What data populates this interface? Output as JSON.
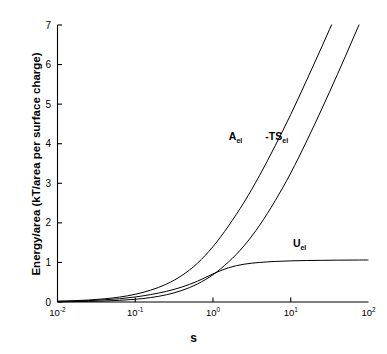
{
  "chart_data": {
    "type": "line",
    "title": "",
    "xlabel": "s",
    "ylabel": "Energy/area (kT/area per surface charge)",
    "xscale": "log",
    "yscale": "linear",
    "xlim": [
      0.01,
      100
    ],
    "ylim": [
      0,
      7
    ],
    "grid": false,
    "legend_position": "inline-annotations",
    "xticks": [
      {
        "value": 0.01,
        "base": "10",
        "exponent": "-2",
        "label": "10-2"
      },
      {
        "value": 0.1,
        "base": "10",
        "exponent": "-1",
        "label": "10-1"
      },
      {
        "value": 1,
        "base": "10",
        "exponent": "0",
        "label": "100"
      },
      {
        "value": 10,
        "base": "10",
        "exponent": "1",
        "label": "101"
      },
      {
        "value": 100,
        "base": "10",
        "exponent": "2",
        "label": "102"
      }
    ],
    "yticks": [
      {
        "value": 0,
        "label": "0"
      },
      {
        "value": 1,
        "label": "1"
      },
      {
        "value": 2,
        "label": "2"
      },
      {
        "value": 3,
        "label": "3"
      },
      {
        "value": 4,
        "label": "4"
      },
      {
        "value": 5,
        "label": "5"
      },
      {
        "value": 6,
        "label": "6"
      },
      {
        "value": 7,
        "label": "7"
      }
    ],
    "series": [
      {
        "name": "A_el",
        "label_base": "A",
        "label_sub": "el",
        "label_prefix": "",
        "color": "#000000",
        "annotation": {
          "x": 1.95,
          "y": 4.1
        },
        "x": [
          0.01,
          0.0158,
          0.0251,
          0.0398,
          0.0631,
          0.1,
          0.158,
          0.251,
          0.398,
          0.631,
          1.0,
          1.58,
          2.51,
          3.98,
          6.31,
          10.0,
          15.8,
          25.1,
          39.8,
          63.1,
          100.0
        ],
        "y": [
          0.02,
          0.032,
          0.05,
          0.08,
          0.125,
          0.195,
          0.3,
          0.45,
          0.67,
          0.98,
          1.4,
          1.92,
          2.52,
          3.2,
          3.95,
          4.74,
          5.58,
          6.45,
          7.34,
          8.25,
          9.18
        ]
      },
      {
        "name": "-TS_el",
        "label_base": "TS",
        "label_sub": "el",
        "label_prefix": "-",
        "color": "#000000",
        "annotation": {
          "x": 6.6,
          "y": 4.1
        },
        "x": [
          0.01,
          0.0158,
          0.0251,
          0.0398,
          0.0631,
          0.1,
          0.158,
          0.251,
          0.398,
          0.631,
          1.0,
          1.58,
          2.51,
          3.98,
          6.31,
          10.0,
          15.8,
          25.1,
          39.8,
          63.1,
          100.0
        ],
        "y": [
          0.005,
          0.009,
          0.015,
          0.025,
          0.042,
          0.068,
          0.112,
          0.182,
          0.292,
          0.455,
          0.69,
          1.01,
          1.42,
          1.94,
          2.56,
          3.26,
          4.04,
          4.88,
          5.75,
          6.65,
          7.57
        ]
      },
      {
        "name": "U_el",
        "label_base": "U",
        "label_sub": "el",
        "label_prefix": "",
        "color": "#000000",
        "annotation": {
          "x": 13.0,
          "y": 1.38
        },
        "x": [
          0.01,
          0.0158,
          0.0251,
          0.0398,
          0.0631,
          0.1,
          0.158,
          0.251,
          0.398,
          0.631,
          1.0,
          1.58,
          2.51,
          3.98,
          6.31,
          10.0,
          15.8,
          25.1,
          39.8,
          63.1,
          100.0
        ],
        "y": [
          0.015,
          0.023,
          0.035,
          0.055,
          0.083,
          0.127,
          0.188,
          0.268,
          0.378,
          0.525,
          0.71,
          0.865,
          0.955,
          1.0,
          1.025,
          1.04,
          1.048,
          1.053,
          1.057,
          1.06,
          1.062
        ]
      }
    ]
  }
}
